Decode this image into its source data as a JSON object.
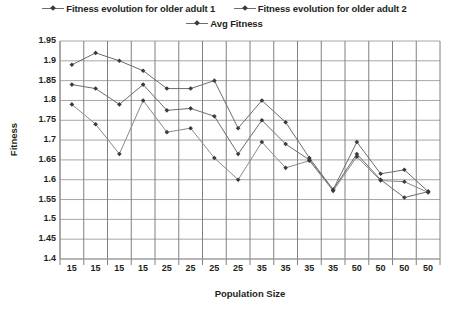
{
  "legend": {
    "items": [
      {
        "label": "Fitness evolution for older adult 1",
        "color": "#6d6d6d",
        "marker": "diamond"
      },
      {
        "label": "Fitness evolution for older adult 2",
        "color": "#6d6d6d",
        "marker": "diamond"
      },
      {
        "label": "Avg Fitness",
        "color": "#6d6d6d",
        "marker": "diamond"
      }
    ],
    "row1": [
      0,
      1
    ],
    "row2": [
      2
    ]
  },
  "chart_data": {
    "type": "line",
    "title": "",
    "xlabel": "Population Size",
    "ylabel": "Fitness",
    "categories": [
      "15",
      "15",
      "15",
      "15",
      "25",
      "25",
      "25",
      "25",
      "35",
      "35",
      "35",
      "35",
      "50",
      "50",
      "50",
      "50"
    ],
    "ylim": [
      1.4,
      1.95
    ],
    "ytick_labels": [
      "1.95",
      "1.9",
      "1.85",
      "1.8",
      "1.75",
      "1.7",
      "1.65",
      "1.6",
      "1.55",
      "1.5",
      "1.45",
      "1.4"
    ],
    "ytick_values": [
      1.95,
      1.9,
      1.85,
      1.8,
      1.75,
      1.7,
      1.65,
      1.6,
      1.55,
      1.5,
      1.45,
      1.4
    ],
    "ystep": 0.05,
    "grid": true,
    "legend_position": "top",
    "series": [
      {
        "name": "Fitness evolution for older adult 1",
        "color": "#6d6d6d",
        "values": [
          1.89,
          1.92,
          1.9,
          1.875,
          1.83,
          1.83,
          1.85,
          1.73,
          1.8,
          1.745,
          1.655,
          1.575,
          1.695,
          1.615,
          1.625,
          1.57
        ]
      },
      {
        "name": "Fitness evolution for older adult 2",
        "color": "#6d6d6d",
        "values": [
          1.84,
          1.83,
          1.79,
          1.84,
          1.775,
          1.78,
          1.76,
          1.665,
          1.75,
          1.69,
          1.65,
          1.575,
          1.665,
          1.6,
          1.555,
          1.57
        ]
      },
      {
        "name": "Avg Fitness",
        "color": "#8a8a8a",
        "values": [
          1.79,
          1.74,
          1.665,
          1.8,
          1.72,
          1.73,
          1.655,
          1.6,
          1.695,
          1.63,
          1.648,
          1.572,
          1.658,
          1.598,
          1.595,
          1.568
        ]
      }
    ]
  },
  "colors": {
    "grid": "#a6a6a6",
    "axis": "#808080",
    "marker": "#3a3a3a",
    "text": "#231f20",
    "background": "#ffffff"
  }
}
